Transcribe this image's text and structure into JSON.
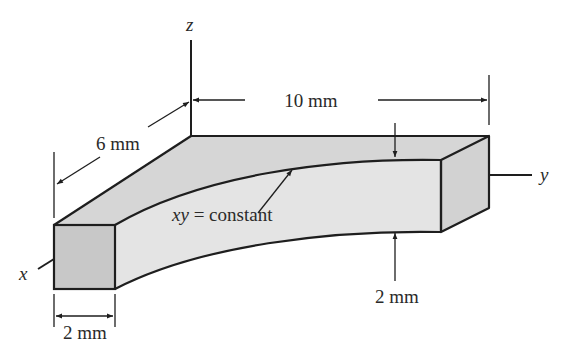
{
  "diagram": {
    "type": "3D isometric beam sketch",
    "axes": {
      "x_label": "x",
      "y_label": "y",
      "z_label": "z"
    },
    "dimensions": {
      "length": "10 mm",
      "depth": "6 mm",
      "width": "2 mm",
      "thickness": "2 mm"
    },
    "annotation": {
      "curve_label_var": "xy",
      "curve_label_rest": " = constant"
    },
    "colors": {
      "line": "#1e1e1e",
      "top_face": "#d6d6d6",
      "front_face": "#e4e4e4",
      "end_face": "#c8c8c8",
      "right_face": "#d2d2d2",
      "text": "#2a2a2a"
    }
  }
}
